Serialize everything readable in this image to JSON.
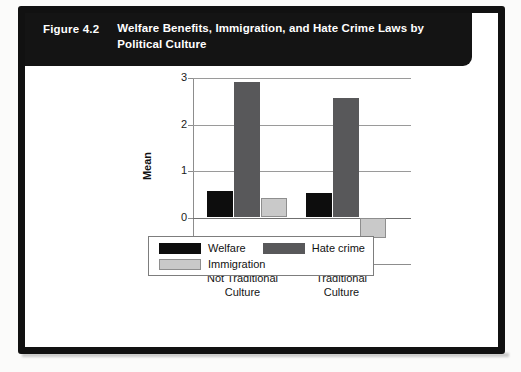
{
  "figure": {
    "number": "Figure 4.2",
    "title": "Welfare Benefits, Immigration, and Hate Crime Laws by Political Culture"
  },
  "chart_data": {
    "type": "bar",
    "title": "Welfare Benefits, Immigration, and Hate Crime Laws by Political Culture",
    "categories": [
      "Not Traditional\nCulture",
      "Traditional\nCulture"
    ],
    "series": [
      {
        "name": "Welfare",
        "values": [
          0.58,
          0.52
        ],
        "color": "#0d0d0d"
      },
      {
        "name": "Hate crime",
        "values": [
          2.92,
          2.58
        ],
        "color": "#58585a"
      },
      {
        "name": "Immigration",
        "values": [
          0.42,
          -0.45
        ],
        "color": "#c9c9c9"
      }
    ],
    "xlabel": "",
    "ylabel": "Mean",
    "ylim": [
      -1,
      3
    ],
    "yticks": [
      "-1",
      "0",
      "1",
      "2",
      "3"
    ],
    "grid": true,
    "legend_position": "bottom"
  },
  "axis": {
    "y_title": "Mean",
    "y_ticks": [
      "3",
      "2",
      "1",
      "0",
      "-1"
    ]
  },
  "categories": [
    {
      "label": "Not Traditional\nCulture"
    },
    {
      "label": "Traditional\nCulture"
    }
  ],
  "legend": {
    "items": [
      {
        "label": "Welfare",
        "swatch": "welfare"
      },
      {
        "label": "Hate crime",
        "swatch": "hatecrime"
      },
      {
        "label": "Immigration",
        "swatch": "immigration"
      }
    ]
  }
}
